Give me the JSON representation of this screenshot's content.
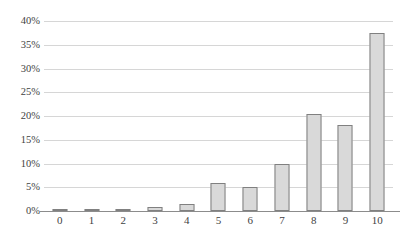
{
  "chart_data": {
    "type": "bar",
    "title": "",
    "subtitle": "",
    "xlabel": "",
    "ylabel": "",
    "categories": [
      "0",
      "1",
      "2",
      "3",
      "4",
      "5",
      "6",
      "7",
      "8",
      "9",
      "10"
    ],
    "values": [
      0.4,
      0.2,
      0.5,
      0.9,
      1.5,
      6.0,
      5.0,
      10.0,
      20.4,
      18.2,
      37.5
    ],
    "value_suffix": "%",
    "ylim": [
      0,
      40
    ],
    "ytick_values": [
      0,
      5,
      10,
      15,
      20,
      25,
      30,
      35,
      40
    ],
    "ytick_labels": [
      "0%",
      "5%",
      "10%",
      "15%",
      "20%",
      "25%",
      "30%",
      "35%",
      "40%"
    ],
    "grid": "horizontal",
    "legend": "none",
    "series": [
      {
        "name": "",
        "values": [
          0.4,
          0.2,
          0.5,
          0.9,
          1.5,
          6.0,
          5.0,
          10.0,
          20.4,
          18.2,
          37.5
        ]
      }
    ]
  },
  "style": {
    "bar_fill": "#d9d9d9",
    "bar_border": "#808080",
    "gridline_color": "#d6d6d6",
    "axis_color": "#8c8c8c",
    "text_color": "#3f3f3f",
    "background": "#ffffff"
  }
}
